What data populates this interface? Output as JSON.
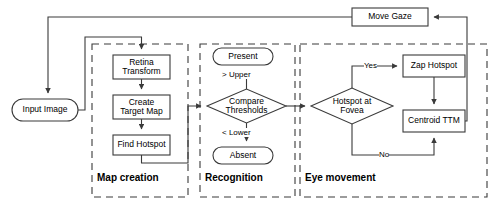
{
  "diagram": {
    "type": "flowchart",
    "colors": {
      "stroke": "#3a3a3a",
      "text": "#000000",
      "background": "#ffffff",
      "dashed_group": "#3a3a3a"
    },
    "nodes": {
      "move_gaze": {
        "label": "Move Gaze",
        "shape": "rect",
        "x": 352,
        "y": 8,
        "w": 76,
        "h": 18
      },
      "input_image": {
        "label": "Input Image",
        "shape": "rounded",
        "x": 12,
        "y": 99,
        "w": 66,
        "h": 22
      },
      "retina_transform": {
        "label": "Retina\nTransform",
        "shape": "rect",
        "x": 113,
        "y": 55,
        "w": 57,
        "h": 24
      },
      "create_target_map": {
        "label": "Create\nTarget Map",
        "shape": "rect",
        "x": 113,
        "y": 95,
        "w": 57,
        "h": 24
      },
      "find_hotspot": {
        "label": "Find Hotspot",
        "shape": "rect",
        "x": 113,
        "y": 135,
        "w": 57,
        "h": 20
      },
      "present": {
        "label": "Present",
        "shape": "rounded",
        "x": 213,
        "y": 48,
        "w": 60,
        "h": 17
      },
      "compare": {
        "label": "Compare\nThresholds",
        "shape": "diamond",
        "x": 207,
        "y": 89,
        "w": 79,
        "h": 34
      },
      "absent": {
        "label": "Absent",
        "shape": "rounded",
        "x": 213,
        "y": 147,
        "w": 60,
        "h": 17
      },
      "hotspot_fovea": {
        "label": "Hotspot at\nFovea",
        "shape": "diamond",
        "x": 311,
        "y": 88,
        "w": 82,
        "h": 36
      },
      "zap_hotspot": {
        "label": "Zap Hotspot",
        "shape": "rect",
        "x": 403,
        "y": 55,
        "w": 62,
        "h": 22
      },
      "centroid_ttm": {
        "label": "Centroid TTM",
        "shape": "rect",
        "x": 403,
        "y": 110,
        "w": 62,
        "h": 22
      }
    },
    "edge_labels": {
      "upper": {
        "text": "> Upper",
        "x": 218,
        "y": 71
      },
      "lower": {
        "text": "< Lower",
        "x": 218,
        "y": 131
      },
      "yes": {
        "text": "Yes",
        "x": 366,
        "y": 58
      },
      "no": {
        "text": "No",
        "x": 366,
        "y": 149
      }
    },
    "groups": [
      {
        "label": "Map creation",
        "x": 92,
        "y": 44,
        "w": 96,
        "h": 153,
        "label_x": 97,
        "label_y": 174
      },
      {
        "label": "Recognition",
        "x": 200,
        "y": 44,
        "w": 95,
        "h": 153,
        "label_x": 205,
        "label_y": 174
      },
      {
        "label": "Eye movement",
        "x": 300,
        "y": 44,
        "w": 187,
        "h": 153,
        "label_x": 305,
        "label_y": 174
      }
    ],
    "flow": [
      {
        "from": "input_image",
        "to": "retina_transform",
        "label": ""
      },
      {
        "from": "retina_transform",
        "to": "create_target_map",
        "label": ""
      },
      {
        "from": "create_target_map",
        "to": "find_hotspot",
        "label": ""
      },
      {
        "from": "find_hotspot",
        "to": "compare",
        "label": ""
      },
      {
        "from": "compare",
        "to": "present",
        "label": "> Upper"
      },
      {
        "from": "compare",
        "to": "absent",
        "label": "< Lower"
      },
      {
        "from": "compare",
        "to": "hotspot_fovea",
        "label": ""
      },
      {
        "from": "hotspot_fovea",
        "to": "zap_hotspot",
        "label": "Yes"
      },
      {
        "from": "hotspot_fovea",
        "to": "centroid_ttm",
        "label": "No"
      },
      {
        "from": "zap_hotspot",
        "to": "centroid_ttm",
        "label": ""
      },
      {
        "from": "centroid_ttm",
        "to": "move_gaze",
        "label": ""
      },
      {
        "from": "move_gaze",
        "to": "input_image",
        "label": ""
      }
    ]
  }
}
